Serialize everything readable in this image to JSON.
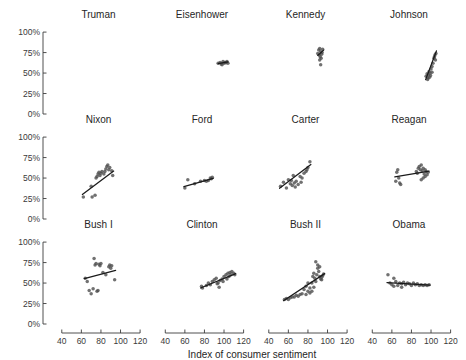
{
  "chart_data": {
    "type": "scatter",
    "title": "",
    "xlabel": "Index of consumer sentiment",
    "ylabel": "",
    "xlim": [
      30,
      125
    ],
    "ylim": [
      0,
      1.05
    ],
    "xticks": [
      40,
      60,
      80,
      100,
      120
    ],
    "xtick_labels": [
      "40",
      "60",
      "80",
      "100",
      "120"
    ],
    "yticks": [
      0,
      0.25,
      0.5,
      0.75,
      1.0
    ],
    "ytick_labels": [
      "0%",
      "25%",
      "50%",
      "75%",
      "100%"
    ],
    "grid": false,
    "legend": "none",
    "layout": {
      "rows": 3,
      "cols": 4
    },
    "marker_color": "#4d4d4d",
    "line_color": "#1a1a1a",
    "panels": [
      {
        "name": "Truman",
        "row": 0,
        "col": 0,
        "points": [],
        "fit": null
      },
      {
        "name": "Eisenhower",
        "row": 0,
        "col": 1,
        "points": [
          [
            94,
            0.62
          ],
          [
            96,
            0.63
          ],
          [
            98,
            0.6
          ],
          [
            99,
            0.64
          ],
          [
            100,
            0.62
          ],
          [
            101,
            0.63
          ],
          [
            103,
            0.64
          ],
          [
            104,
            0.62
          ],
          [
            97,
            0.61
          ],
          [
            102,
            0.625
          ]
        ],
        "fit": {
          "x0": 94,
          "y0": 0.615,
          "x1": 104,
          "y1": 0.635
        }
      },
      {
        "name": "Kennedy",
        "row": 0,
        "col": 2,
        "points": [
          [
            90,
            0.74
          ],
          [
            91,
            0.78
          ],
          [
            92,
            0.8
          ],
          [
            93,
            0.76
          ],
          [
            94,
            0.73
          ],
          [
            95,
            0.79
          ],
          [
            92.5,
            0.7
          ],
          [
            93.5,
            0.68
          ],
          [
            91.5,
            0.72
          ],
          [
            94.5,
            0.75
          ],
          [
            93,
            0.6
          ],
          [
            92,
            0.66
          ]
        ],
        "fit": {
          "x0": 90,
          "y0": 0.715,
          "x1": 96,
          "y1": 0.78
        }
      },
      {
        "name": "Johnson",
        "row": 0,
        "col": 3,
        "points": [
          [
            95,
            0.46
          ],
          [
            96,
            0.49
          ],
          [
            97,
            0.44
          ],
          [
            98,
            0.52
          ],
          [
            99,
            0.5
          ],
          [
            100,
            0.55
          ],
          [
            101,
            0.58
          ],
          [
            102,
            0.62
          ],
          [
            103,
            0.68
          ],
          [
            104,
            0.72
          ],
          [
            105,
            0.74
          ],
          [
            103.5,
            0.7
          ],
          [
            97.5,
            0.48
          ],
          [
            99.5,
            0.47
          ],
          [
            101,
            0.51
          ],
          [
            104.5,
            0.66
          ],
          [
            96.5,
            0.42
          ],
          [
            98.5,
            0.45
          ]
        ],
        "fit": {
          "x0": 94.5,
          "y0": 0.42,
          "x1": 105.5,
          "y1": 0.77
        }
      },
      {
        "name": "Nixon",
        "row": 1,
        "col": 0,
        "points": [
          [
            62,
            0.27
          ],
          [
            70,
            0.4
          ],
          [
            71,
            0.27
          ],
          [
            74,
            0.29
          ],
          [
            76,
            0.52
          ],
          [
            77,
            0.55
          ],
          [
            78,
            0.57
          ],
          [
            79,
            0.53
          ],
          [
            80,
            0.56
          ],
          [
            81,
            0.58
          ],
          [
            85,
            0.61
          ],
          [
            86,
            0.64
          ],
          [
            88,
            0.6
          ],
          [
            89,
            0.63
          ],
          [
            91,
            0.59
          ],
          [
            92,
            0.53
          ],
          [
            83,
            0.55
          ],
          [
            84,
            0.58
          ],
          [
            87,
            0.66
          ],
          [
            75,
            0.5
          ]
        ],
        "fit": {
          "x0": 61,
          "y0": 0.3,
          "x1": 93,
          "y1": 0.585
        }
      },
      {
        "name": "Ford",
        "row": 1,
        "col": 1,
        "points": [
          [
            60,
            0.38
          ],
          [
            63,
            0.48
          ],
          [
            70,
            0.43
          ],
          [
            76,
            0.46
          ],
          [
            80,
            0.47
          ],
          [
            84,
            0.47
          ],
          [
            86,
            0.5
          ],
          [
            87,
            0.49
          ],
          [
            88,
            0.51
          ],
          [
            82,
            0.46
          ]
        ],
        "fit": {
          "x0": 59,
          "y0": 0.395,
          "x1": 89,
          "y1": 0.495
        }
      },
      {
        "name": "Carter",
        "row": 1,
        "col": 2,
        "points": [
          [
            52,
            0.4
          ],
          [
            55,
            0.45
          ],
          [
            58,
            0.38
          ],
          [
            60,
            0.48
          ],
          [
            62,
            0.43
          ],
          [
            64,
            0.41
          ],
          [
            66,
            0.44
          ],
          [
            68,
            0.46
          ],
          [
            70,
            0.42
          ],
          [
            72,
            0.52
          ],
          [
            74,
            0.5
          ],
          [
            76,
            0.56
          ],
          [
            78,
            0.58
          ],
          [
            80,
            0.63
          ],
          [
            82,
            0.7
          ],
          [
            79,
            0.6
          ],
          [
            65,
            0.53
          ],
          [
            67,
            0.39
          ],
          [
            63,
            0.47
          ],
          [
            73,
            0.45
          ]
        ],
        "fit": {
          "x0": 51,
          "y0": 0.375,
          "x1": 83,
          "y1": 0.665
        }
      },
      {
        "name": "Reagan",
        "row": 1,
        "col": 3,
        "points": [
          [
            64,
            0.46
          ],
          [
            65,
            0.57
          ],
          [
            66,
            0.6
          ],
          [
            67,
            0.5
          ],
          [
            68,
            0.44
          ],
          [
            69,
            0.42
          ],
          [
            85,
            0.58
          ],
          [
            87,
            0.62
          ],
          [
            88,
            0.64
          ],
          [
            89,
            0.6
          ],
          [
            90,
            0.66
          ],
          [
            91,
            0.59
          ],
          [
            92,
            0.62
          ],
          [
            93,
            0.55
          ],
          [
            94,
            0.52
          ],
          [
            95,
            0.58
          ],
          [
            96,
            0.54
          ],
          [
            97,
            0.57
          ],
          [
            90,
            0.48
          ],
          [
            92,
            0.5
          ],
          [
            86,
            0.56
          ],
          [
            94,
            0.6
          ]
        ],
        "fit": {
          "x0": 63,
          "y0": 0.515,
          "x1": 98,
          "y1": 0.585
        }
      },
      {
        "name": "Bush I",
        "row": 2,
        "col": 0,
        "points": [
          [
            64,
            0.56
          ],
          [
            66,
            0.52
          ],
          [
            68,
            0.41
          ],
          [
            70,
            0.37
          ],
          [
            72,
            0.43
          ],
          [
            73,
            0.8
          ],
          [
            74,
            0.72
          ],
          [
            75,
            0.74
          ],
          [
            76,
            0.4
          ],
          [
            77,
            0.41
          ],
          [
            78,
            0.73
          ],
          [
            79,
            0.71
          ],
          [
            80,
            0.74
          ],
          [
            82,
            0.63
          ],
          [
            88,
            0.7
          ],
          [
            89,
            0.72
          ],
          [
            90,
            0.68
          ],
          [
            91,
            0.71
          ],
          [
            94,
            0.54
          ],
          [
            85,
            0.6
          ]
        ],
        "fit": {
          "x0": 63,
          "y0": 0.555,
          "x1": 95,
          "y1": 0.655
        }
      },
      {
        "name": "Clinton",
        "row": 2,
        "col": 1,
        "points": [
          [
            77,
            0.46
          ],
          [
            78,
            0.44
          ],
          [
            82,
            0.47
          ],
          [
            84,
            0.5
          ],
          [
            86,
            0.48
          ],
          [
            88,
            0.52
          ],
          [
            90,
            0.54
          ],
          [
            92,
            0.56
          ],
          [
            94,
            0.5
          ],
          [
            95,
            0.45
          ],
          [
            96,
            0.53
          ],
          [
            98,
            0.55
          ],
          [
            100,
            0.58
          ],
          [
            102,
            0.6
          ],
          [
            104,
            0.62
          ],
          [
            105,
            0.58
          ],
          [
            106,
            0.63
          ],
          [
            107,
            0.6
          ],
          [
            108,
            0.64
          ],
          [
            110,
            0.62
          ],
          [
            111,
            0.6
          ],
          [
            103,
            0.55
          ],
          [
            99,
            0.52
          ],
          [
            93,
            0.49
          ]
        ],
        "fit": {
          "x0": 76,
          "y0": 0.44,
          "x1": 112,
          "y1": 0.615
        }
      },
      {
        "name": "Bush II",
        "row": 2,
        "col": 2,
        "points": [
          [
            56,
            0.3
          ],
          [
            58,
            0.31
          ],
          [
            60,
            0.3
          ],
          [
            62,
            0.32
          ],
          [
            64,
            0.33
          ],
          [
            66,
            0.33
          ],
          [
            68,
            0.35
          ],
          [
            70,
            0.34
          ],
          [
            72,
            0.36
          ],
          [
            74,
            0.37
          ],
          [
            76,
            0.42
          ],
          [
            78,
            0.46
          ],
          [
            80,
            0.4
          ],
          [
            82,
            0.44
          ],
          [
            84,
            0.5
          ],
          [
            85,
            0.58
          ],
          [
            86,
            0.62
          ],
          [
            87,
            0.56
          ],
          [
            88,
            0.52
          ],
          [
            89,
            0.6
          ],
          [
            90,
            0.68
          ],
          [
            91,
            0.64
          ],
          [
            92,
            0.58
          ],
          [
            93,
            0.55
          ],
          [
            94,
            0.57
          ],
          [
            95,
            0.59
          ],
          [
            96,
            0.61
          ],
          [
            88,
            0.76
          ],
          [
            90,
            0.72
          ],
          [
            92,
            0.7
          ],
          [
            86,
            0.45
          ],
          [
            84,
            0.4
          ],
          [
            82,
            0.38
          ],
          [
            80,
            0.5
          ],
          [
            78,
            0.36
          ],
          [
            94,
            0.54
          ]
        ],
        "fit": {
          "x0": 55,
          "y0": 0.285,
          "x1": 97,
          "y1": 0.615
        }
      },
      {
        "name": "Obama",
        "row": 2,
        "col": 3,
        "points": [
          [
            56,
            0.6
          ],
          [
            58,
            0.5
          ],
          [
            60,
            0.48
          ],
          [
            62,
            0.56
          ],
          [
            64,
            0.52
          ],
          [
            66,
            0.47
          ],
          [
            68,
            0.5
          ],
          [
            70,
            0.49
          ],
          [
            72,
            0.51
          ],
          [
            74,
            0.48
          ],
          [
            76,
            0.5
          ],
          [
            78,
            0.49
          ],
          [
            80,
            0.47
          ],
          [
            82,
            0.5
          ],
          [
            84,
            0.48
          ],
          [
            86,
            0.49
          ],
          [
            88,
            0.47
          ],
          [
            90,
            0.48
          ],
          [
            92,
            0.47
          ],
          [
            94,
            0.48
          ],
          [
            96,
            0.47
          ],
          [
            98,
            0.48
          ],
          [
            62,
            0.46
          ],
          [
            70,
            0.45
          ]
        ],
        "fit": {
          "x0": 55,
          "y0": 0.505,
          "x1": 99,
          "y1": 0.475
        }
      }
    ]
  }
}
